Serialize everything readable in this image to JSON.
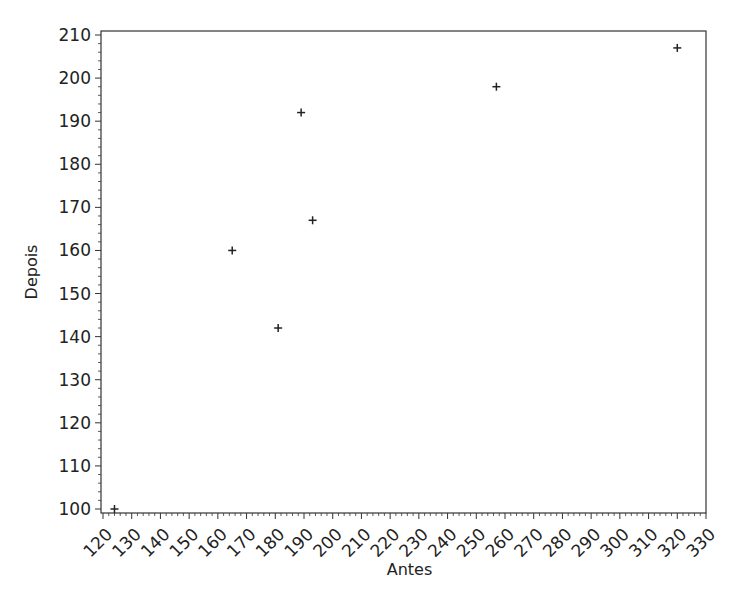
{
  "chart_data": {
    "type": "scatter",
    "title": "",
    "xlabel": "Antes",
    "ylabel": "Depois",
    "xlim": [
      120,
      330
    ],
    "ylim": [
      100,
      210
    ],
    "xticks": [
      120,
      130,
      140,
      150,
      160,
      170,
      180,
      190,
      200,
      210,
      220,
      230,
      240,
      250,
      260,
      270,
      280,
      290,
      300,
      310,
      320,
      330
    ],
    "yticks": [
      100,
      110,
      120,
      130,
      140,
      150,
      160,
      170,
      180,
      190,
      200,
      210
    ],
    "grid": false,
    "legend": null,
    "marker": "+",
    "series": [
      {
        "name": "Depois vs Antes",
        "points": [
          {
            "x": 124,
            "y": 100
          },
          {
            "x": 165,
            "y": 160
          },
          {
            "x": 181,
            "y": 142
          },
          {
            "x": 189,
            "y": 192
          },
          {
            "x": 193,
            "y": 167
          },
          {
            "x": 257,
            "y": 198
          },
          {
            "x": 320,
            "y": 207
          }
        ]
      }
    ]
  },
  "colors": {
    "axis": "#333333",
    "marker": "#222222",
    "background": "#ffffff"
  }
}
